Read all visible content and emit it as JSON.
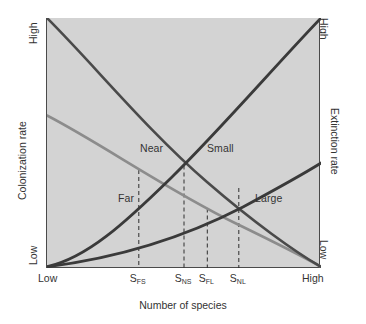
{
  "figure": {
    "background": "#ffffff",
    "plot_background": "#d3d3d3",
    "frame_color": "#4a4a4a"
  },
  "axes": {
    "x": {
      "title": "Number of species",
      "low_label": "Low",
      "high_label": "High",
      "ticks": [
        {
          "id": "S_FS",
          "base": "S",
          "sub": "FS",
          "position_fraction": 0.335
        },
        {
          "id": "S_NS",
          "base": "S",
          "sub": "NS",
          "position_fraction": 0.5
        },
        {
          "id": "S_FL",
          "base": "S",
          "sub": "FL",
          "position_fraction": 0.585
        },
        {
          "id": "S_NL",
          "base": "S",
          "sub": "NL",
          "position_fraction": 0.7
        }
      ]
    },
    "y_left": {
      "title": "Colonization rate",
      "high_label": "High",
      "low_label": "Low"
    },
    "y_right": {
      "title": "Extinction rate",
      "high_label": "High",
      "low_label": "Low"
    }
  },
  "curve_labels": {
    "near": "Near",
    "far": "Far",
    "small": "Small",
    "large": "Large"
  },
  "chart_data": {
    "type": "line",
    "title": "",
    "xlabel": "Number of species",
    "ylabel": "Colonization rate",
    "ylabel_secondary": "Extinction rate",
    "xlim": [
      0,
      1
    ],
    "ylim": [
      0,
      1
    ],
    "xtick_labels": [
      "Low",
      "S_FS",
      "S_NS",
      "S_FL",
      "S_NL",
      "High"
    ],
    "ytick_labels": [
      "Low",
      "High"
    ],
    "grid": false,
    "legend": "inline-curve-labels",
    "series": [
      {
        "name": "Near",
        "role": "colonization",
        "color": "#4a4a4a",
        "width": 2.6,
        "description": "Immigration curve for a near island: starts High, decays convexly to Low",
        "x": [
          0.0,
          0.1,
          0.2,
          0.3,
          0.4,
          0.5,
          0.6,
          0.7,
          0.8,
          0.9,
          1.0
        ],
        "y": [
          1.0,
          0.855,
          0.725,
          0.61,
          0.505,
          0.41,
          0.32,
          0.235,
          0.155,
          0.078,
          0.005
        ]
      },
      {
        "name": "Far",
        "role": "colonization",
        "color": "#8c8c8c",
        "width": 2.6,
        "description": "Immigration curve for a far island: starts mid-height, decays to Low",
        "x": [
          0.0,
          0.1,
          0.2,
          0.3,
          0.4,
          0.5,
          0.6,
          0.7,
          0.8,
          0.9,
          1.0
        ],
        "y": [
          0.61,
          0.54,
          0.472,
          0.408,
          0.345,
          0.285,
          0.228,
          0.172,
          0.118,
          0.062,
          0.005
        ]
      },
      {
        "name": "Small",
        "role": "extinction",
        "color": "#3a3a3a",
        "width": 2.8,
        "description": "Extinction curve for a small island: rises steeply to High at right",
        "x": [
          0.0,
          0.1,
          0.2,
          0.3,
          0.4,
          0.5,
          0.6,
          0.7,
          0.8,
          0.9,
          1.0
        ],
        "y": [
          0.005,
          0.055,
          0.115,
          0.185,
          0.275,
          0.41,
          0.54,
          0.665,
          0.79,
          0.9,
          1.0
        ]
      },
      {
        "name": "Large",
        "role": "extinction",
        "color": "#3a3a3a",
        "width": 2.8,
        "description": "Extinction curve for a large island: rises shallowly, reaching mid-height at right",
        "x": [
          0.0,
          0.1,
          0.2,
          0.3,
          0.4,
          0.5,
          0.6,
          0.7,
          0.8,
          0.9,
          1.0
        ],
        "y": [
          0.005,
          0.03,
          0.062,
          0.1,
          0.145,
          0.195,
          0.252,
          0.32,
          0.405,
          0.505,
          0.62
        ]
      }
    ],
    "intersections": [
      {
        "label": "S_FS",
        "x": 0.335,
        "y": 0.392,
        "curves": [
          "Far",
          "Small"
        ]
      },
      {
        "label": "S_NS",
        "x": 0.5,
        "y": 0.41,
        "curves": [
          "Near",
          "Small"
        ]
      },
      {
        "label": "S_FL",
        "x": 0.585,
        "y": 0.238,
        "curves": [
          "Far",
          "Large"
        ]
      },
      {
        "label": "S_NL",
        "x": 0.7,
        "y": 0.32,
        "curves": [
          "Near",
          "Large"
        ]
      }
    ],
    "annotations": [
      {
        "text": "Near",
        "x": 0.215,
        "y": 0.545
      },
      {
        "text": "Small",
        "x": 0.465,
        "y": 0.545
      },
      {
        "text": "Far",
        "x": 0.115,
        "y": 0.345
      },
      {
        "text": "Large",
        "x": 0.635,
        "y": 0.345
      }
    ]
  }
}
